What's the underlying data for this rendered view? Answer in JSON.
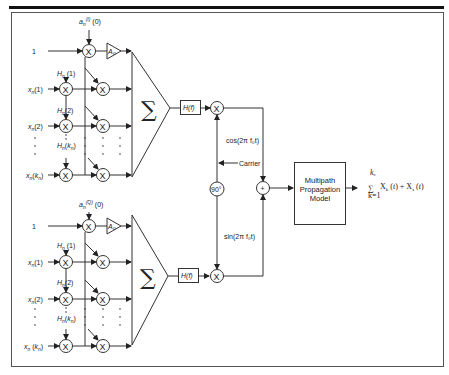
{
  "diagram": {
    "type": "block-diagram",
    "title": "",
    "branches": {
      "inphase": {
        "symbol_label": "a_n^(I) (0)",
        "sym_sup": "(I)",
        "unity_input": "1",
        "amp_label": "A₀",
        "inputs": [
          "x_n(1)",
          "x_n(2)",
          "x_n(k_n)"
        ],
        "taps": [
          "H_n(1)",
          "H_n(2)",
          "H_n(k_n)"
        ],
        "sum_symbol": "∑",
        "filter_label": "H(f)",
        "carrier_label": "cos(2π f₀t)"
      },
      "quadrature": {
        "symbol_label": "a_n^(Q) (0)",
        "sym_sup": "(Q)",
        "unity_input": "1",
        "amp_label": "A₀",
        "inputs": [
          "x_n(1)",
          "x_n(2)",
          "x_n(k_n)"
        ],
        "taps": [
          "H_n(1)",
          "H_n(2)",
          "H_n(k_n)"
        ],
        "sum_symbol": "∑",
        "filter_label": "H(f)",
        "carrier_label": "sin(2π f₀t)"
      }
    },
    "mixer_symbol": "X",
    "adder_symbol": "+",
    "phase_shift_label": "90°",
    "carrier_source_label": "Carrier",
    "channel_box": [
      "Multipath",
      "Propagation",
      "Model"
    ],
    "output_label": {
      "sum_top": "k_n",
      "sum_bottom": "k=1",
      "expr": "X_k (t) + X_s (t)"
    }
  }
}
